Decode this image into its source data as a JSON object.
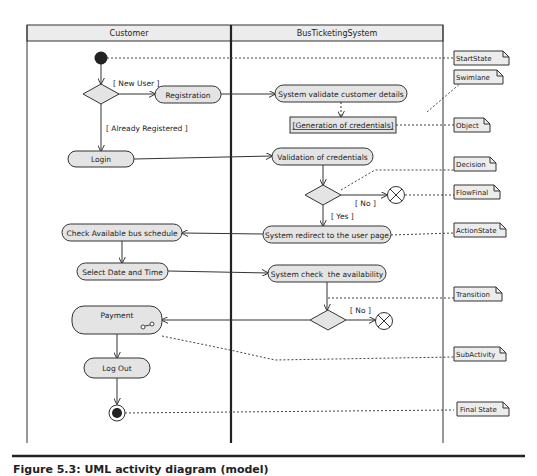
{
  "diagram": {
    "type": "UML activity diagram",
    "swimlanes": [
      {
        "id": "customer",
        "label": "Customer"
      },
      {
        "id": "system",
        "label": "BusTicketingSystem"
      }
    ],
    "nodes": {
      "start": {
        "kind": "initial",
        "lane": "customer"
      },
      "decision_user": {
        "kind": "decision",
        "lane": "customer"
      },
      "registration": {
        "kind": "action",
        "label": "Registration",
        "lane": "customer"
      },
      "validate_details": {
        "kind": "action",
        "label": "System validate customer details",
        "lane": "system"
      },
      "gen_credentials": {
        "kind": "object",
        "label": "[Generation of credentials]",
        "lane": "system"
      },
      "login": {
        "kind": "action",
        "label": "Login",
        "lane": "customer"
      },
      "validate_credentials": {
        "kind": "action",
        "label": "Validation of credentials",
        "lane": "system"
      },
      "decision_valid": {
        "kind": "decision",
        "lane": "system"
      },
      "flowfinal_1": {
        "kind": "flow-final",
        "lane": "system"
      },
      "redirect": {
        "kind": "action",
        "label": "System redirect to the user page",
        "lane": "system"
      },
      "check_schedule": {
        "kind": "action",
        "label": "Check Available bus schedule",
        "lane": "customer"
      },
      "select_date": {
        "kind": "action",
        "label": "Select Date and Time",
        "lane": "customer"
      },
      "check_availability": {
        "kind": "action",
        "label": "System check  the availability",
        "lane": "system"
      },
      "decision_avail": {
        "kind": "decision",
        "lane": "system"
      },
      "flowfinal_2": {
        "kind": "flow-final",
        "lane": "system"
      },
      "payment": {
        "kind": "subactivity",
        "label": "Payment",
        "lane": "customer"
      },
      "logout": {
        "kind": "action",
        "label": "Log Out",
        "lane": "customer"
      },
      "final": {
        "kind": "final",
        "lane": "customer"
      }
    },
    "guards": {
      "new_user": "[ New User ]",
      "already_registered": "[ Already Registered ]",
      "no_1": "[ No ]",
      "yes": "[ Yes ]",
      "no_2": "[ No ]"
    },
    "edges": [
      {
        "from": "start",
        "to": "decision_user"
      },
      {
        "from": "decision_user",
        "to": "registration",
        "guard": "[ New User ]"
      },
      {
        "from": "decision_user",
        "to": "login",
        "guard": "[ Already Registered ]"
      },
      {
        "from": "registration",
        "to": "validate_details"
      },
      {
        "from": "validate_details",
        "to": "gen_credentials",
        "style": "dashed"
      },
      {
        "from": "login",
        "to": "validate_credentials"
      },
      {
        "from": "validate_credentials",
        "to": "decision_valid"
      },
      {
        "from": "decision_valid",
        "to": "flowfinal_1",
        "guard": "[ No ]"
      },
      {
        "from": "decision_valid",
        "to": "redirect",
        "guard": "[ Yes ]"
      },
      {
        "from": "redirect",
        "to": "check_schedule"
      },
      {
        "from": "check_schedule",
        "to": "select_date"
      },
      {
        "from": "select_date",
        "to": "check_availability"
      },
      {
        "from": "check_availability",
        "to": "decision_avail"
      },
      {
        "from": "decision_avail",
        "to": "flowfinal_2",
        "guard": "[No]"
      },
      {
        "from": "decision_avail",
        "to": "payment"
      },
      {
        "from": "payment",
        "to": "logout"
      },
      {
        "from": "logout",
        "to": "final"
      }
    ],
    "notes": [
      {
        "label": "StartState",
        "targets": "start"
      },
      {
        "label": "Swimlane",
        "targets": "swimlane-divider"
      },
      {
        "label": "Object",
        "targets": "gen_credentials"
      },
      {
        "label": "Decision",
        "targets": "decision_valid"
      },
      {
        "label": "FlowFinal",
        "targets": "flowfinal_1"
      },
      {
        "label": "ActionState",
        "targets": "redirect"
      },
      {
        "label": "Transition",
        "targets": "edge check_availability->decision_avail"
      },
      {
        "label": "SubActivity",
        "targets": "payment"
      },
      {
        "label": "Final State",
        "targets": "final"
      }
    ],
    "colors": {
      "node_fill": "#e4e4e4",
      "stroke": "#333333",
      "header_fill": "#ececec",
      "lane_divider": "#222222"
    }
  },
  "caption": "Figure 5.3: UML activity diagram (model)"
}
